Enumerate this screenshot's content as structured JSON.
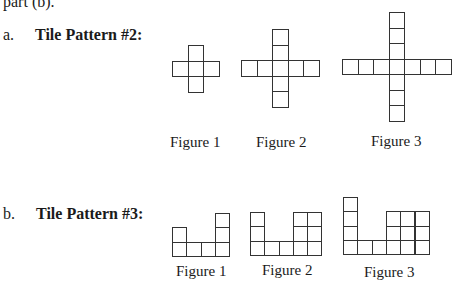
{
  "lead_text": "part (b).",
  "patterns": [
    {
      "letter": "a.",
      "title": "Tile Pattern #2:",
      "letter_pos": [
        3,
        27
      ],
      "title_pos": [
        35,
        27
      ],
      "tile_size": 15.5,
      "figures": [
        {
          "label": "Figure 1",
          "origin": [
            172,
            45
          ],
          "label_pos": [
            170,
            135
          ],
          "cells": [
            [
              1,
              0
            ],
            [
              0,
              1
            ],
            [
              1,
              1
            ],
            [
              2,
              1
            ],
            [
              1,
              2
            ]
          ]
        },
        {
          "label": "Figure 2",
          "origin": [
            241,
            29
          ],
          "label_pos": [
            256,
            135
          ],
          "cells": [
            [
              2,
              0
            ],
            [
              2,
              1
            ],
            [
              0,
              2
            ],
            [
              1,
              2
            ],
            [
              2,
              2
            ],
            [
              3,
              2
            ],
            [
              4,
              2
            ],
            [
              2,
              3
            ],
            [
              2,
              4
            ]
          ]
        },
        {
          "label": "Figure 3",
          "origin": [
            342,
            12
          ],
          "label_pos": [
            371,
            134
          ],
          "cells": [
            [
              3,
              0
            ],
            [
              3,
              1
            ],
            [
              3,
              2
            ],
            [
              0,
              3
            ],
            [
              1,
              3
            ],
            [
              2,
              3
            ],
            [
              3,
              3
            ],
            [
              4,
              3
            ],
            [
              5,
              3
            ],
            [
              6,
              3
            ],
            [
              3,
              4
            ],
            [
              3,
              5
            ],
            [
              3,
              6
            ]
          ]
        }
      ]
    },
    {
      "letter": "b.",
      "title": "Tile Pattern #3:",
      "letter_pos": [
        3,
        206
      ],
      "title_pos": [
        36,
        206
      ],
      "tile_size": 14.3,
      "figures": [
        {
          "label": "Figure 1",
          "origin": [
            172,
            213
          ],
          "label_pos": [
            176,
            264
          ],
          "cells": [
            [
              3,
              0
            ],
            [
              0,
              1
            ],
            [
              3,
              1
            ],
            [
              0,
              2
            ],
            [
              1,
              2
            ],
            [
              2,
              2
            ],
            [
              3,
              2
            ]
          ]
        },
        {
          "label": "Figure 2",
          "origin": [
            250,
            212
          ],
          "label_pos": [
            262,
            263
          ],
          "cells": [
            [
              0,
              0
            ],
            [
              3,
              0
            ],
            [
              4,
              0
            ],
            [
              0,
              1
            ],
            [
              3,
              1
            ],
            [
              4,
              1
            ],
            [
              0,
              2
            ],
            [
              1,
              2
            ],
            [
              2,
              2
            ],
            [
              3,
              2
            ],
            [
              4,
              2
            ]
          ]
        },
        {
          "label": "Figure 3",
          "origin": [
            343,
            197
          ],
          "label_pos": [
            364,
            265
          ],
          "cells": [
            [
              0,
              0
            ],
            [
              0,
              1
            ],
            [
              3,
              1
            ],
            [
              4,
              1
            ],
            [
              5,
              1
            ],
            [
              0,
              2
            ],
            [
              3,
              2
            ],
            [
              4,
              2
            ],
            [
              5,
              2
            ],
            [
              0,
              3
            ],
            [
              1,
              3
            ],
            [
              2,
              3
            ],
            [
              3,
              3
            ],
            [
              4,
              3
            ],
            [
              5,
              3
            ]
          ]
        }
      ]
    }
  ]
}
